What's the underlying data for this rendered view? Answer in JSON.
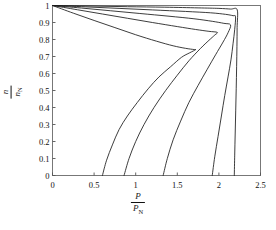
{
  "chart_data": {
    "type": "line",
    "title": "",
    "subtitle": "",
    "xlabel": "P / P_N",
    "ylabel": "n / n_N",
    "xlabel_parts": {
      "numerator": "P",
      "denominator": "P",
      "denominator_sub": "N"
    },
    "ylabel_parts": {
      "numerator": "n",
      "denominator": "n",
      "denominator_sub": "N"
    },
    "xlim": [
      0,
      2.5
    ],
    "ylim": [
      0,
      1
    ],
    "grid": false,
    "legend": false,
    "legend_position": "none",
    "xticks": [
      "0",
      "0.5",
      "1",
      "1.5",
      "2",
      "2.5"
    ],
    "xtick_values": [
      0,
      0.5,
      1,
      1.5,
      2,
      2.5
    ],
    "yticks": [
      "0",
      "0.1",
      "0.2",
      "0.3",
      "0.4",
      "0.5",
      "0.6",
      "0.7",
      "0.8",
      "0.9",
      "1"
    ],
    "ytick_values": [
      0,
      0.1,
      0.2,
      0.3,
      0.4,
      0.5,
      0.6,
      0.7,
      0.8,
      0.9,
      1.0
    ],
    "line_color": "#1a1a1a",
    "axis_color": "#555555",
    "background": "#ffffff",
    "series": [
      {
        "name": "curve-1",
        "common_origin": [
          0.0,
          1.0
        ],
        "x_intercept": 0.6,
        "nose": [
          1.72,
          0.74
        ],
        "points_upper": [
          [
            0.0,
            1.0
          ],
          [
            0.25,
            0.955
          ],
          [
            0.5,
            0.912
          ],
          [
            0.75,
            0.87
          ],
          [
            1.0,
            0.828
          ],
          [
            1.25,
            0.79
          ],
          [
            1.45,
            0.763
          ],
          [
            1.6,
            0.748
          ],
          [
            1.7,
            0.741
          ],
          [
            1.72,
            0.74
          ]
        ],
        "points_lower": [
          [
            0.6,
            0.0
          ],
          [
            0.65,
            0.09
          ],
          [
            0.72,
            0.18
          ],
          [
            0.8,
            0.27
          ],
          [
            0.9,
            0.35
          ],
          [
            1.02,
            0.43
          ],
          [
            1.15,
            0.51
          ],
          [
            1.28,
            0.58
          ],
          [
            1.42,
            0.64
          ],
          [
            1.55,
            0.695
          ],
          [
            1.65,
            0.722
          ],
          [
            1.72,
            0.74
          ]
        ]
      },
      {
        "name": "curve-2",
        "common_origin": [
          0.0,
          1.0
        ],
        "x_intercept": 0.86,
        "nose": [
          1.98,
          0.84
        ],
        "points_upper": [
          [
            0.0,
            1.0
          ],
          [
            0.3,
            0.975
          ],
          [
            0.6,
            0.95
          ],
          [
            0.9,
            0.925
          ],
          [
            1.2,
            0.9
          ],
          [
            1.5,
            0.876
          ],
          [
            1.72,
            0.859
          ],
          [
            1.88,
            0.848
          ],
          [
            1.98,
            0.842
          ]
        ],
        "points_lower": [
          [
            0.86,
            0.0
          ],
          [
            0.92,
            0.1
          ],
          [
            1.0,
            0.2
          ],
          [
            1.1,
            0.3
          ],
          [
            1.22,
            0.4
          ],
          [
            1.36,
            0.5
          ],
          [
            1.5,
            0.59
          ],
          [
            1.64,
            0.675
          ],
          [
            1.78,
            0.748
          ],
          [
            1.88,
            0.795
          ],
          [
            1.95,
            0.826
          ],
          [
            1.98,
            0.842
          ]
        ]
      },
      {
        "name": "curve-3",
        "common_origin": [
          0.0,
          1.0
        ],
        "x_intercept": 1.33,
        "nose": [
          2.14,
          0.885
        ],
        "points_upper": [
          [
            0.0,
            1.0
          ],
          [
            0.35,
            0.985
          ],
          [
            0.7,
            0.969
          ],
          [
            1.05,
            0.953
          ],
          [
            1.4,
            0.937
          ],
          [
            1.7,
            0.922
          ],
          [
            1.92,
            0.907
          ],
          [
            2.06,
            0.895
          ],
          [
            2.14,
            0.886
          ]
        ],
        "points_lower": [
          [
            1.33,
            0.0
          ],
          [
            1.38,
            0.1
          ],
          [
            1.45,
            0.21
          ],
          [
            1.54,
            0.32
          ],
          [
            1.64,
            0.43
          ],
          [
            1.75,
            0.53
          ],
          [
            1.86,
            0.625
          ],
          [
            1.96,
            0.71
          ],
          [
            2.05,
            0.785
          ],
          [
            2.11,
            0.84
          ],
          [
            2.14,
            0.886
          ]
        ]
      },
      {
        "name": "curve-4",
        "common_origin": [
          0.0,
          1.0
        ],
        "x_intercept": 1.92,
        "nose": [
          2.2,
          0.935
        ],
        "points_upper": [
          [
            0.0,
            1.0
          ],
          [
            0.4,
            0.992
          ],
          [
            0.8,
            0.983
          ],
          [
            1.2,
            0.974
          ],
          [
            1.6,
            0.965
          ],
          [
            1.9,
            0.957
          ],
          [
            2.08,
            0.948
          ],
          [
            2.17,
            0.94
          ],
          [
            2.2,
            0.934
          ]
        ],
        "points_lower": [
          [
            1.92,
            0.0
          ],
          [
            1.95,
            0.11
          ],
          [
            1.99,
            0.23
          ],
          [
            2.03,
            0.35
          ],
          [
            2.07,
            0.47
          ],
          [
            2.11,
            0.58
          ],
          [
            2.145,
            0.68
          ],
          [
            2.17,
            0.775
          ],
          [
            2.19,
            0.86
          ],
          [
            2.2,
            0.934
          ]
        ]
      },
      {
        "name": "curve-5",
        "common_origin": [
          0.0,
          1.0
        ],
        "x_intercept": 2.185,
        "nose": [
          2.22,
          0.975
        ],
        "points_upper": [
          [
            0.0,
            1.0
          ],
          [
            0.45,
            0.997
          ],
          [
            0.9,
            0.993
          ],
          [
            1.35,
            0.99
          ],
          [
            1.75,
            0.986
          ],
          [
            2.0,
            0.983
          ],
          [
            2.14,
            0.979
          ],
          [
            2.22,
            0.975
          ]
        ],
        "points_lower": [
          [
            2.185,
            0.0
          ],
          [
            2.19,
            0.12
          ],
          [
            2.196,
            0.25
          ],
          [
            2.202,
            0.38
          ],
          [
            2.208,
            0.51
          ],
          [
            2.213,
            0.64
          ],
          [
            2.217,
            0.76
          ],
          [
            2.219,
            0.87
          ],
          [
            2.22,
            0.975
          ]
        ]
      }
    ]
  },
  "axes": {
    "x_label_num": "P",
    "x_label_den": "P",
    "x_label_den_sub": "N",
    "y_label_num": "n",
    "y_label_den": "n",
    "y_label_den_sub": "N"
  }
}
